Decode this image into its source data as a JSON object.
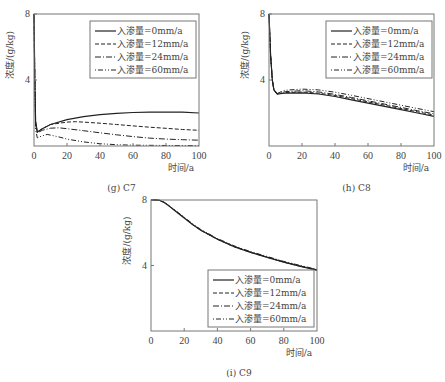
{
  "chart_data": [
    {
      "id": "g",
      "type": "line",
      "caption": "(g) C7",
      "xlabel": "时间/a",
      "ylabel": "浓度/(g/kg)",
      "xlim": [
        0,
        100
      ],
      "ylim": [
        0,
        8
      ],
      "xticks": [
        0,
        20,
        40,
        60,
        80,
        100
      ],
      "yticks": [
        4,
        8
      ],
      "grid": false,
      "legend_position": "upper right",
      "box": {
        "x0": 34,
        "y0": 14,
        "x1": 199,
        "y1": 146
      },
      "legend_box": {
        "x": 90,
        "y": 21,
        "w": 106,
        "h": 57
      },
      "series": [
        {
          "name": "入渗量=0mm/a",
          "dash": "",
          "x": [
            0,
            0.5,
            1,
            2,
            5,
            10,
            20,
            30,
            40,
            50,
            60,
            70,
            80,
            90,
            100
          ],
          "y": [
            8,
            4,
            1.5,
            0.85,
            1.05,
            1.3,
            1.6,
            1.78,
            1.9,
            1.98,
            2.03,
            2.05,
            2.06,
            2.05,
            2.0
          ]
        },
        {
          "name": "入渗量=12mm/a",
          "dash": "4,2",
          "x": [
            0,
            0.5,
            1,
            2,
            5,
            10,
            20,
            25,
            30,
            40,
            50,
            60,
            70,
            80,
            90,
            100
          ],
          "y": [
            8,
            4,
            1.5,
            0.85,
            1.05,
            1.3,
            1.45,
            1.47,
            1.45,
            1.38,
            1.3,
            1.22,
            1.14,
            1.07,
            1.0,
            0.95
          ]
        },
        {
          "name": "入渗量=24mm/a",
          "dash": "6,2,1,2",
          "x": [
            0,
            0.5,
            1,
            2,
            5,
            10,
            15,
            20,
            30,
            40,
            50,
            60,
            70,
            80,
            90,
            100
          ],
          "y": [
            8,
            4,
            1.3,
            0.8,
            0.95,
            1.08,
            1.1,
            1.05,
            0.93,
            0.8,
            0.68,
            0.57,
            0.48,
            0.42,
            0.38,
            0.35
          ]
        },
        {
          "name": "入渗量=60mm/a",
          "dash": "1,2,5,2,1,2",
          "x": [
            0,
            0.5,
            1,
            2,
            5,
            8,
            15,
            20,
            30,
            40,
            50,
            60,
            70,
            80,
            100
          ],
          "y": [
            8,
            4,
            1.0,
            0.5,
            0.62,
            0.7,
            0.55,
            0.42,
            0.25,
            0.14,
            0.08,
            0.05,
            0.04,
            0.03,
            0.02
          ]
        }
      ]
    },
    {
      "id": "h",
      "type": "line",
      "caption": "(h) C8",
      "xlabel": "时间/a",
      "ylabel": "浓度/(g/kg)",
      "xlim": [
        0,
        100
      ],
      "ylim": [
        0,
        8
      ],
      "xticks": [
        0,
        20,
        40,
        60,
        80,
        100
      ],
      "yticks": [
        4,
        8
      ],
      "grid": false,
      "legend_position": "upper right",
      "box": {
        "x0": 269,
        "y0": 14,
        "x1": 434,
        "y1": 146
      },
      "legend_box": {
        "x": 326,
        "y": 21,
        "w": 106,
        "h": 57
      },
      "series": [
        {
          "name": "入渗量=0mm/a",
          "dash": "",
          "x": [
            0,
            1,
            2,
            3,
            5,
            8,
            10,
            20,
            30,
            40,
            50,
            60,
            70,
            80,
            90,
            100
          ],
          "y": [
            8,
            5.5,
            4.0,
            3.4,
            3.15,
            3.18,
            3.2,
            3.22,
            3.15,
            3.0,
            2.8,
            2.6,
            2.4,
            2.2,
            2.0,
            1.8
          ]
        },
        {
          "name": "入渗量=12mm/a",
          "dash": "4,2",
          "x": [
            0,
            1,
            2,
            3,
            5,
            8,
            10,
            20,
            30,
            40,
            50,
            60,
            70,
            80,
            90,
            100
          ],
          "y": [
            8,
            5.5,
            4.0,
            3.4,
            3.15,
            3.2,
            3.24,
            3.27,
            3.2,
            3.06,
            2.87,
            2.67,
            2.47,
            2.27,
            2.07,
            1.87
          ]
        },
        {
          "name": "入渗量=24mm/a",
          "dash": "6,2,1,2",
          "x": [
            0,
            1,
            2,
            3,
            5,
            8,
            10,
            20,
            30,
            40,
            50,
            60,
            70,
            80,
            90,
            100
          ],
          "y": [
            8,
            5.5,
            4.0,
            3.4,
            3.15,
            3.25,
            3.3,
            3.35,
            3.28,
            3.13,
            2.94,
            2.74,
            2.54,
            2.34,
            2.14,
            1.95
          ]
        },
        {
          "name": "入渗量=60mm/a",
          "dash": "1,2,5,2,1,2",
          "x": [
            0,
            1,
            2,
            3,
            5,
            8,
            10,
            20,
            30,
            40,
            50,
            60,
            70,
            80,
            90,
            100
          ],
          "y": [
            8,
            5.5,
            4.0,
            3.4,
            3.18,
            3.32,
            3.38,
            3.45,
            3.4,
            3.26,
            3.07,
            2.87,
            2.67,
            2.47,
            2.27,
            2.08
          ]
        }
      ]
    },
    {
      "id": "i",
      "type": "line",
      "caption": "(i) C9",
      "xlabel": "时间/a",
      "ylabel": "浓度/(g/kg)",
      "xlim": [
        0,
        100
      ],
      "ylim": [
        0,
        8
      ],
      "xticks": [
        0,
        20,
        40,
        60,
        80,
        100
      ],
      "yticks": [
        4,
        8
      ],
      "grid": false,
      "legend_position": "lower right",
      "box": {
        "x0": 151,
        "y0": 200,
        "x1": 317,
        "y1": 331
      },
      "legend_box": {
        "x": 208,
        "y": 270,
        "w": 106,
        "h": 57
      },
      "series": [
        {
          "name": "入渗量=0mm/a",
          "dash": "",
          "x": [
            0,
            3,
            5,
            8,
            10,
            15,
            20,
            25,
            30,
            40,
            50,
            60,
            70,
            80,
            90,
            100
          ],
          "y": [
            8,
            8,
            7.98,
            7.85,
            7.7,
            7.3,
            6.9,
            6.5,
            6.15,
            5.6,
            5.15,
            4.8,
            4.5,
            4.2,
            3.95,
            3.72
          ]
        },
        {
          "name": "入渗量=12mm/a",
          "dash": "4,2",
          "x": [
            0,
            3,
            5,
            8,
            10,
            15,
            20,
            25,
            30,
            40,
            50,
            60,
            70,
            80,
            90,
            100
          ],
          "y": [
            8,
            8,
            7.98,
            7.85,
            7.7,
            7.3,
            6.9,
            6.5,
            6.15,
            5.6,
            5.15,
            4.8,
            4.5,
            4.2,
            3.95,
            3.72
          ]
        },
        {
          "name": "入渗量=24mm/a",
          "dash": "6,2,1,2",
          "x": [
            0,
            3,
            5,
            8,
            10,
            15,
            20,
            25,
            30,
            40,
            50,
            60,
            70,
            80,
            90,
            100
          ],
          "y": [
            8,
            8,
            7.98,
            7.85,
            7.7,
            7.32,
            6.92,
            6.52,
            6.17,
            5.62,
            5.17,
            4.82,
            4.52,
            4.22,
            3.97,
            3.74
          ]
        },
        {
          "name": "入渗量=60mm/a",
          "dash": "1,2,5,2,1,2",
          "x": [
            0,
            3,
            5,
            8,
            10,
            15,
            20,
            25,
            30,
            40,
            50,
            60,
            70,
            80,
            90,
            100
          ],
          "y": [
            8,
            8,
            7.98,
            7.86,
            7.72,
            7.34,
            6.95,
            6.55,
            6.2,
            5.65,
            5.2,
            4.85,
            4.55,
            4.25,
            4.0,
            3.76
          ]
        }
      ]
    }
  ]
}
